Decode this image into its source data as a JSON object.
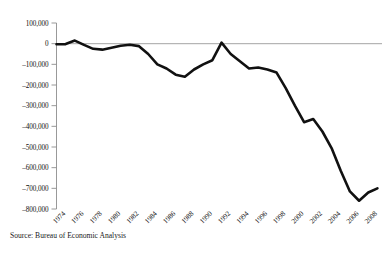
{
  "chart_data": {
    "type": "line",
    "title": "",
    "subtitle": "",
    "xlabel": "",
    "ylabel": "",
    "source_note": "Source: Bureau of Economic Analysis",
    "grid": false,
    "legend": "none",
    "zero_reference_line": true,
    "xlim": [
      1973,
      2008.5
    ],
    "ylim": [
      -800000,
      100000
    ],
    "ytick_labels": [
      "100,000",
      "0",
      "–100,000",
      "–200,000",
      "–300,000",
      "–400,000",
      "–500,000",
      "–600,000",
      "–700,000",
      "–800,000"
    ],
    "ytick_values": [
      100000,
      0,
      -100000,
      -200000,
      -300000,
      -400000,
      -500000,
      -600000,
      -700000,
      -800000
    ],
    "xtick_labels": [
      "1974",
      "1976",
      "1978",
      "1980",
      "1982",
      "1984",
      "1986",
      "1988",
      "1990",
      "1992",
      "1994",
      "1996",
      "1998",
      "2000",
      "2002",
      "2004",
      "2006",
      "2008"
    ],
    "xtick_values": [
      1974,
      1976,
      1978,
      1980,
      1982,
      1984,
      1986,
      1988,
      1990,
      1992,
      1994,
      1996,
      1998,
      2000,
      2002,
      2004,
      2006,
      2008
    ],
    "x": [
      1973,
      1974,
      1975,
      1976,
      1977,
      1978,
      1979,
      1980,
      1981,
      1982,
      1983,
      1984,
      1985,
      1986,
      1987,
      1988,
      1989,
      1990,
      1991,
      1992,
      1993,
      1994,
      1995,
      1996,
      1997,
      1998,
      1999,
      2000,
      2001,
      2002,
      2003,
      2004,
      2005,
      2006,
      2007,
      2008
    ],
    "values": [
      -3000,
      -2000,
      15000,
      -6000,
      -25000,
      -29000,
      -20000,
      -10000,
      -5000,
      -12000,
      -50000,
      -100000,
      -120000,
      -150000,
      -160000,
      -125000,
      -100000,
      -80000,
      5000,
      -50000,
      -85000,
      -120000,
      -115000,
      -125000,
      -140000,
      -215000,
      -300000,
      -380000,
      -365000,
      -425000,
      -505000,
      -615000,
      -715000,
      -760000,
      -720000,
      -700000
    ],
    "series_name": "U.S. balance on current account",
    "units": "millions of dollars"
  },
  "figure": {
    "axis_color": "#8d8d8d",
    "line_color": "#111111",
    "zero_line_color": "#9a9a9a",
    "background": "#ffffff"
  }
}
